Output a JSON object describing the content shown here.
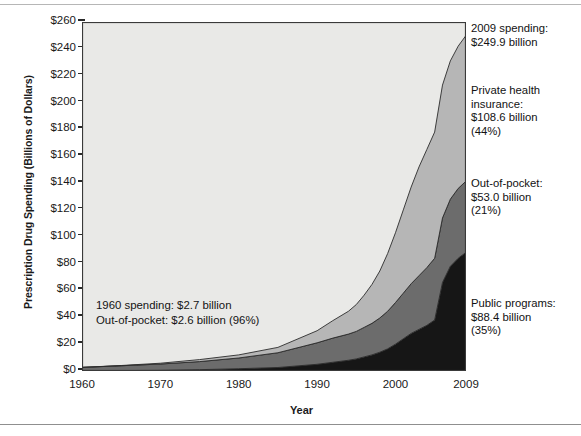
{
  "chart_data": {
    "type": "area",
    "title": "",
    "xlabel": "Year",
    "ylabel": "Prescription Drug Spending (Billions of Dollars)",
    "xlim": [
      1960,
      2009
    ],
    "ylim": [
      0,
      260
    ],
    "xticks": [
      "1960",
      "1970",
      "1980",
      "1990",
      "2000",
      "2009"
    ],
    "xtick_values": [
      1960,
      1970,
      1980,
      1990,
      2000,
      2009
    ],
    "yticks": [
      "$0",
      "$20",
      "$40",
      "$60",
      "$80",
      "$100",
      "$120",
      "$140",
      "$160",
      "$180",
      "$200",
      "$220",
      "$240",
      "$260"
    ],
    "ytick_values": [
      0,
      20,
      40,
      60,
      80,
      100,
      120,
      140,
      160,
      180,
      200,
      220,
      240,
      260
    ],
    "grid": false,
    "stacked": true,
    "legend_position": "annotations-right",
    "x": [
      1960,
      1965,
      1970,
      1975,
      1980,
      1985,
      1990,
      1992,
      1994,
      1995,
      1996,
      1997,
      1998,
      1999,
      2000,
      2001,
      2002,
      2003,
      2004,
      2005,
      2006,
      2007,
      2008,
      2009
    ],
    "series": [
      {
        "name": "Public programs",
        "color": "#161616",
        "values": [
          0.1,
          0.3,
          0.5,
          1.0,
          1.7,
          2.6,
          5.0,
          6.5,
          8.0,
          9.0,
          10.5,
          12.0,
          14.0,
          16.5,
          20.0,
          24.0,
          28.0,
          31.0,
          34.0,
          38.0,
          66.0,
          78.0,
          84.0,
          88.4
        ]
      },
      {
        "name": "Out-of-pocket",
        "color": "#6c6c6c",
        "values": [
          2.6,
          3.6,
          4.7,
          6.0,
          8.0,
          11.0,
          16.0,
          18.0,
          19.5,
          20.5,
          22.0,
          23.5,
          25.5,
          28.0,
          31.0,
          34.0,
          37.0,
          40.0,
          43.0,
          46.0,
          48.0,
          50.0,
          52.0,
          53.0
        ]
      },
      {
        "name": "Private health insurance",
        "color": "#b6b6b6",
        "values": [
          0.0,
          0.2,
          0.6,
          1.5,
          2.3,
          4.0,
          9.0,
          13.0,
          17.0,
          20.0,
          24.0,
          29.0,
          35.0,
          43.0,
          52.0,
          62.0,
          72.0,
          81.0,
          88.0,
          94.0,
          99.0,
          103.0,
          106.0,
          108.6
        ]
      }
    ],
    "totals": [
      2.7,
      4.1,
      5.8,
      8.5,
      12.0,
      17.6,
      30.0,
      37.5,
      44.5,
      49.5,
      56.5,
      64.5,
      74.5,
      87.5,
      103.0,
      120.0,
      137.0,
      152.0,
      165.0,
      178.0,
      213.0,
      231.0,
      242.0,
      249.9
    ]
  },
  "annotations": {
    "total_2009": "2009 spending:\n$249.9 billion",
    "private": "Private health\ninsurance:\n$108.6 billion\n(44%)",
    "out_of_pocket": "Out-of-pocket:\n$53.0 billion\n(21%)",
    "public": "Public programs:\n$88.4 billion\n(35%)",
    "note_1960": "1960 spending: $2.7 billion\nOut-of-pocket: $2.6 billion (96%)"
  }
}
